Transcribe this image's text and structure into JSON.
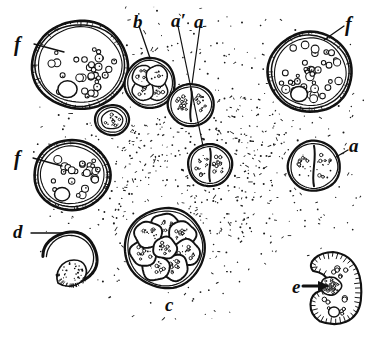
{
  "figure": {
    "medium": "stipple line engraving",
    "ink_color": "#111111",
    "paper_color": "#ffffff",
    "width_px": 380,
    "height_px": 343
  },
  "labels": [
    {
      "id": "f-top-left",
      "text": "f",
      "x": 14,
      "y": 34,
      "size": 20,
      "leader": true
    },
    {
      "id": "b-top",
      "text": "b",
      "x": 133,
      "y": 12,
      "size": 19,
      "leader": true
    },
    {
      "id": "a-prime-top",
      "text": "a′",
      "x": 171,
      "y": 11,
      "size": 19,
      "leader": true
    },
    {
      "id": "a-top",
      "text": "a",
      "x": 194,
      "y": 12,
      "size": 19,
      "leader": true
    },
    {
      "id": "f-top-right",
      "text": "f",
      "x": 345,
      "y": 14,
      "size": 20,
      "leader": true
    },
    {
      "id": "f-mid-left",
      "text": "f",
      "x": 14,
      "y": 148,
      "size": 20,
      "leader": true
    },
    {
      "id": "a-right",
      "text": "a",
      "x": 349,
      "y": 136,
      "size": 19,
      "leader": true
    },
    {
      "id": "d-left",
      "text": "d",
      "x": 13,
      "y": 222,
      "size": 19,
      "leader": true
    },
    {
      "id": "c-bottom",
      "text": "c",
      "x": 165,
      "y": 295,
      "size": 19,
      "leader": false
    },
    {
      "id": "e-bottom-right",
      "text": "e",
      "x": 292,
      "y": 277,
      "size": 19,
      "leader": true
    }
  ],
  "specimens": [
    {
      "id": "cyst-large-upper-left",
      "label": "f",
      "stage": "mature cyst with granular contents",
      "cx": 80,
      "cy": 65,
      "rx": 48,
      "ry": 44,
      "wall": "thick double wall",
      "granules": 34,
      "vacuoles": 1
    },
    {
      "id": "cyst-upper-right",
      "label": "f",
      "stage": "mature cyst with granular contents",
      "cx": 310,
      "cy": 72,
      "rx": 42,
      "ry": 40,
      "wall": "thick double wall",
      "granules": 40,
      "vacuoles": 1
    },
    {
      "id": "cyst-mid-left",
      "label": "f",
      "stage": "mature cyst with granular contents",
      "cx": 72,
      "cy": 175,
      "rx": 38,
      "ry": 35,
      "wall": "thick double wall",
      "granules": 26,
      "vacuoles": 1
    },
    {
      "id": "four-cell-b",
      "label": "b",
      "stage": "four-celled division stage",
      "cx": 150,
      "cy": 83,
      "rx": 25,
      "ry": 25,
      "cells": 4
    },
    {
      "id": "two-cell-a-upper",
      "label": "a",
      "stage": "two-celled division stage",
      "cx": 191,
      "cy": 105,
      "rx": 23,
      "ry": 21,
      "cells": 2
    },
    {
      "id": "two-cell-a-prime",
      "label": "a′",
      "stage": "two-celled division stage",
      "cx": 210,
      "cy": 165,
      "rx": 22,
      "ry": 21,
      "cells": 2
    },
    {
      "id": "two-cell-a-right",
      "label": "a",
      "stage": "two-celled division stage",
      "cx": 314,
      "cy": 166,
      "rx": 26,
      "ry": 25,
      "cells": 2
    },
    {
      "id": "single-cell-small",
      "label": "",
      "stage": "single undivided cell",
      "cx": 112,
      "cy": 120,
      "rx": 17,
      "ry": 15,
      "cells": 1
    },
    {
      "id": "morula-c",
      "label": "c",
      "stage": "multicellular morula, about eight segments",
      "cx": 165,
      "cy": 248,
      "rx": 40,
      "ry": 40,
      "cells": 8
    },
    {
      "id": "empty-cyst-d",
      "label": "d",
      "stage": "ruptured cyst with escaping organism",
      "cx": 70,
      "cy": 258,
      "rx": 27,
      "ry": 26
    },
    {
      "id": "ciliate-e",
      "label": "e",
      "stage": "free ciliated organism with nucleus and vacuoles",
      "cx": 335,
      "cy": 290,
      "rx": 28,
      "ry": 38,
      "cilia": 44
    }
  ],
  "background": {
    "name": "stippled tissue field",
    "description": "dense irregular stipple covering the central field and fading toward the margins",
    "stipple_dots": 2600
  }
}
